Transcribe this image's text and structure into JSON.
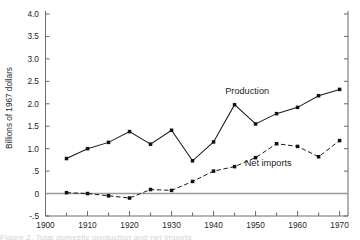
{
  "chart_data": {
    "type": "line",
    "title": "",
    "xlabel": "",
    "ylabel": "Billions of 1967 dollars",
    "xlim": [
      1900,
      1972
    ],
    "ylim": [
      -0.5,
      4.0
    ],
    "grid": false,
    "legend_position": "inline-annotation",
    "y_ticks": [
      {
        "value": 4.0,
        "label": "4.0"
      },
      {
        "value": 3.5,
        "label": "3.5"
      },
      {
        "value": 3.0,
        "label": "3.0"
      },
      {
        "value": 2.5,
        "label": "2.5"
      },
      {
        "value": 2.0,
        "label": "2.0"
      },
      {
        "value": 1.5,
        "label": "1.5"
      },
      {
        "value": 1.0,
        "label": "1.0"
      },
      {
        "value": 0.5,
        "label": ".5"
      },
      {
        "value": 0.0,
        "label": "0"
      },
      {
        "value": -0.5,
        "label": "-.5"
      }
    ],
    "x_ticks": [
      {
        "value": 1900,
        "label": "1900"
      },
      {
        "value": 1905,
        "label": ""
      },
      {
        "value": 1910,
        "label": "1910"
      },
      {
        "value": 1915,
        "label": ""
      },
      {
        "value": 1920,
        "label": "1920"
      },
      {
        "value": 1925,
        "label": ""
      },
      {
        "value": 1930,
        "label": "1930"
      },
      {
        "value": 1935,
        "label": ""
      },
      {
        "value": 1940,
        "label": "1940"
      },
      {
        "value": 1945,
        "label": ""
      },
      {
        "value": 1950,
        "label": "1950"
      },
      {
        "value": 1955,
        "label": ""
      },
      {
        "value": 1960,
        "label": "1960"
      },
      {
        "value": 1965,
        "label": ""
      },
      {
        "value": 1970,
        "label": "1970"
      }
    ],
    "x": [
      1905,
      1910,
      1915,
      1920,
      1925,
      1930,
      1935,
      1940,
      1945,
      1950,
      1955,
      1960,
      1965,
      1970
    ],
    "series": [
      {
        "name": "Production",
        "style": "solid",
        "marker": "filled-square",
        "x": [
          1905,
          1910,
          1915,
          1920,
          1925,
          1930,
          1935,
          1940,
          1945,
          1950,
          1955,
          1960,
          1965,
          1970
        ],
        "values": [
          0.78,
          1.0,
          1.14,
          1.38,
          1.1,
          1.41,
          0.73,
          1.15,
          1.98,
          1.55,
          1.78,
          1.92,
          2.18,
          2.32
        ]
      },
      {
        "name": "Net imports",
        "style": "dashed",
        "marker": "filled-square",
        "x": [
          1905,
          1910,
          1915,
          1920,
          1925,
          1930,
          1935,
          1940,
          1945,
          1950,
          1955,
          1960,
          1965,
          1970
        ],
        "values": [
          0.02,
          0.0,
          -0.05,
          -0.1,
          0.09,
          0.07,
          0.27,
          0.5,
          0.6,
          0.8,
          1.11,
          1.05,
          0.82,
          1.18
        ]
      }
    ],
    "annotations": [
      {
        "text": "Production",
        "x": 1948,
        "y": 2.22
      },
      {
        "text": "Net imports",
        "x": 1953,
        "y": 0.62
      }
    ]
  },
  "caption": {
    "partial_text": "Figure 2.  Total domestic production and net imports"
  }
}
